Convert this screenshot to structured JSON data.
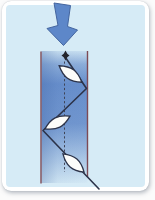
{
  "diagram": {
    "type": "flow-tube-particle-trajectory-schematic",
    "colors": {
      "page_bg": "#fbfbfb",
      "card_bg": "#ffffff",
      "panel_bg": "#d6ebf6",
      "column_blue": "#4f7ac2",
      "column_edge_shade": "#3a5fa0",
      "wall_line": "#7d4a55",
      "arrow_fill": "#5d87c9",
      "arrow_stroke": "#44659f",
      "path_stroke": "#2c3349",
      "dashed_axis": "#3f4456",
      "particle_fill": "#fdfdfa",
      "particle_stroke": "#2c3349",
      "marker_fill": "#23242c"
    },
    "arrow": {
      "points": "54,3 70.5,5.5 67.5,26.5 77.5,30 63.5,45.5 47,28.5 58,25.5"
    },
    "column": {
      "x": 41.5,
      "y": 51,
      "width": 46,
      "height": 132
    },
    "walls": {
      "left": {
        "x": 41,
        "y1": 51.5,
        "y2": 183.5
      },
      "right": {
        "x": 87.5,
        "y1": 51,
        "y2": 177
      }
    },
    "center_line": {
      "x": 64.5,
      "y1": 61.5,
      "y2": 172,
      "dash": "2.2 2.2"
    },
    "trajectory": {
      "points": "65.5,57.5 86.5,88.5 43,130.5 99,189"
    },
    "start_marker": {
      "cx": 65.5,
      "cy": 55.5,
      "r": 5
    },
    "particles": [
      {
        "cx": 70.5,
        "cy": 74,
        "rx": 14,
        "ry": 5.2,
        "angle": 36
      },
      {
        "cx": 57.5,
        "cy": 122.5,
        "rx": 14,
        "ry": 5.2,
        "angle": -27
      },
      {
        "cx": 73.5,
        "cy": 163,
        "rx": 14,
        "ry": 5.2,
        "angle": 41
      }
    ]
  }
}
